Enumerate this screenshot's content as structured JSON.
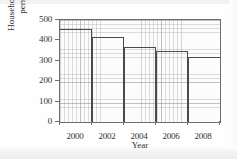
{
  "chart_data": {
    "type": "bar",
    "title": "",
    "xlabel": "Year",
    "ylabel_line1": "Household waste per",
    "ylabel_line2": "person (kg)",
    "ylabel": "Household waste per person (kg)",
    "categories": [
      "2000",
      "2002",
      "2004",
      "2006",
      "2008"
    ],
    "bar_intervals": [
      {
        "start": "1999",
        "end": "2001",
        "center_label": "2000"
      },
      {
        "start": "2001",
        "end": "2003",
        "center_label": "2002"
      },
      {
        "start": "2003",
        "end": "2005",
        "center_label": "2004"
      },
      {
        "start": "2005",
        "end": "2007",
        "center_label": "2006"
      },
      {
        "start": "2007",
        "end": "2009",
        "center_label": "2008"
      }
    ],
    "values": [
      455,
      418,
      370,
      348,
      320
    ],
    "xlim": [
      1999,
      2009
    ],
    "ylim": [
      0,
      500
    ],
    "yticks": [
      0,
      100,
      200,
      300,
      400,
      500
    ],
    "xticks": [
      1999,
      2001,
      2003,
      2005,
      2007,
      2009
    ],
    "xtick_labels_positions": [
      2000,
      2002,
      2004,
      2006,
      2008
    ],
    "grid": true,
    "legend": "none",
    "bar_edge_color": "#4a4a4a",
    "bar_fill_color": "none",
    "grid_color": "#969696",
    "axis_color": "#6e6e6e"
  }
}
